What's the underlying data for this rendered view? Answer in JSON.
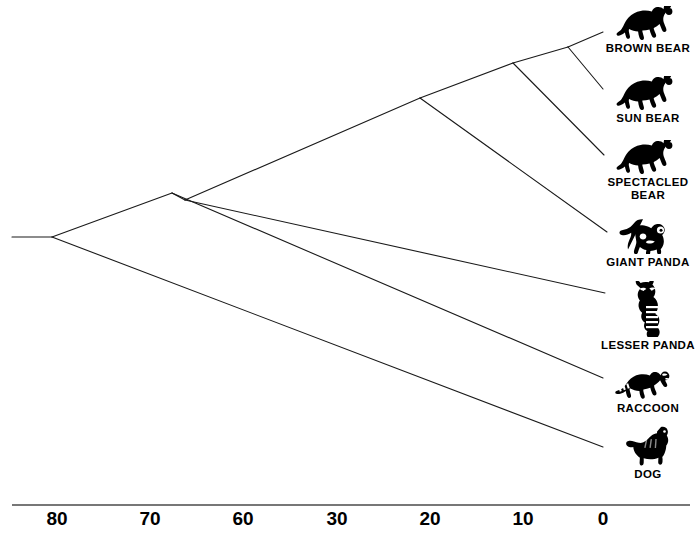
{
  "figure": {
    "type": "phylogenetic-tree",
    "title": "",
    "background_color": "#ffffff",
    "line_color": "#1a1a1a",
    "text_color": "#000000"
  },
  "axis": {
    "orientation": "horizontal",
    "line_y": 505,
    "line_x_start": 12,
    "line_x_end": 690,
    "direction": "right-to-left-decreasing",
    "ticks": [
      {
        "label": "80",
        "x": 57
      },
      {
        "label": "70",
        "x": 150
      },
      {
        "label": "60",
        "x": 243
      },
      {
        "label": "30",
        "x": 337
      },
      {
        "label": "20",
        "x": 430
      },
      {
        "label": "10",
        "x": 523
      },
      {
        "label": "0",
        "x": 603
      }
    ]
  },
  "taxa": [
    {
      "name": "brown-bear",
      "label": "BROWN BEAR",
      "icon": "bear-silhouette-icon",
      "tip_x": 603,
      "tip_y": 32,
      "icon_x": 648,
      "icon_y": 6
    },
    {
      "name": "sun-bear",
      "label": "SUN BEAR",
      "icon": "bear-silhouette-icon",
      "tip_x": 603,
      "tip_y": 89,
      "icon_x": 648,
      "icon_y": 76
    },
    {
      "name": "spectacled-bear",
      "label": "SPECTACLED\nBEAR",
      "icon": "bear-silhouette-icon",
      "tip_x": 604,
      "tip_y": 155,
      "icon_x": 648,
      "icon_y": 140
    },
    {
      "name": "giant-panda",
      "label": "GIANT PANDA",
      "icon": "giant-panda-icon",
      "tip_x": 607,
      "tip_y": 232,
      "icon_x": 648,
      "icon_y": 218
    },
    {
      "name": "lesser-panda",
      "label": "LESSER PANDA",
      "icon": "lesser-panda-icon",
      "tip_x": 605,
      "tip_y": 293,
      "icon_x": 648,
      "icon_y": 281
    },
    {
      "name": "raccoon",
      "label": "RACCOON",
      "icon": "raccoon-icon",
      "tip_x": 603,
      "tip_y": 378,
      "icon_x": 648,
      "icon_y": 370
    },
    {
      "name": "dog",
      "label": "DOG",
      "icon": "dog-icon",
      "tip_x": 603,
      "tip_y": 447,
      "icon_x": 648,
      "icon_y": 424
    }
  ],
  "nodes": [
    {
      "name": "root-stub-left",
      "x": 12,
      "y": 237
    },
    {
      "name": "root",
      "x": 52,
      "y": 237
    },
    {
      "name": "node-carnivora-upper",
      "x": 172,
      "y": 193
    },
    {
      "name": "node-procyonid-ursid",
      "x": 185,
      "y": 200
    },
    {
      "name": "node-ursidae-panda",
      "x": 420,
      "y": 98
    },
    {
      "name": "node-bear-clade",
      "x": 513,
      "y": 63
    },
    {
      "name": "node-brown-sun",
      "x": 568,
      "y": 47
    }
  ],
  "branches": [
    {
      "name": "root-stub",
      "x1": 12,
      "y1": 237,
      "x2": 52,
      "y2": 237
    },
    {
      "name": "root-to-dog",
      "x1": 52,
      "y1": 237,
      "x2": 603,
      "y2": 447
    },
    {
      "name": "root-to-upper",
      "x1": 52,
      "y1": 237,
      "x2": 172,
      "y2": 193
    },
    {
      "name": "upper-to-raccoon",
      "x1": 172,
      "y1": 193,
      "x2": 603,
      "y2": 378
    },
    {
      "name": "upper-to-inner",
      "x1": 172,
      "y1": 193,
      "x2": 185,
      "y2": 200
    },
    {
      "name": "inner-to-lesser-panda",
      "x1": 185,
      "y1": 200,
      "x2": 605,
      "y2": 293
    },
    {
      "name": "inner-to-ursid-panda",
      "x1": 185,
      "y1": 200,
      "x2": 420,
      "y2": 98
    },
    {
      "name": "ursidpanda-to-giant-panda",
      "x1": 420,
      "y1": 98,
      "x2": 607,
      "y2": 232
    },
    {
      "name": "ursidpanda-to-bears",
      "x1": 420,
      "y1": 98,
      "x2": 513,
      "y2": 63
    },
    {
      "name": "bears-to-spectacled",
      "x1": 513,
      "y1": 63,
      "x2": 604,
      "y2": 155
    },
    {
      "name": "bears-to-brownsun",
      "x1": 513,
      "y1": 63,
      "x2": 568,
      "y2": 47
    },
    {
      "name": "brownsun-to-brown",
      "x1": 568,
      "y1": 47,
      "x2": 603,
      "y2": 32
    },
    {
      "name": "brownsun-to-sun",
      "x1": 568,
      "y1": 47,
      "x2": 603,
      "y2": 89
    }
  ]
}
